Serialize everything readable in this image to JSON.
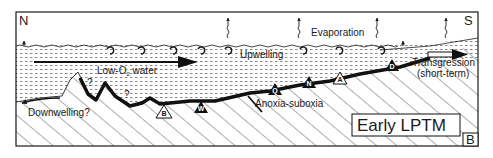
{
  "figure": {
    "panel_label": "B",
    "title": "Early LPTM",
    "colors": {
      "ink": "#1a1a1a",
      "background": "#ffffff"
    }
  },
  "compass": {
    "left": "N",
    "right": "S"
  },
  "labels": {
    "evaporation": "Evaporation",
    "upwelling": "Upwelling",
    "low_o2_water_prefix": "Low-O",
    "low_o2_water_sub": "2",
    "low_o2_water_suffix": " water",
    "downwelling": "Downwelling?",
    "anoxia": "Anoxia-suboxia",
    "transgression_line1": "Transgression",
    "transgression_line2": "(short-term)",
    "question_mark": "?"
  },
  "sites": [
    {
      "code": "B",
      "style": "open"
    },
    {
      "code": "W",
      "style": "filled"
    },
    {
      "code": "Q",
      "style": "filled"
    },
    {
      "code": "N",
      "style": "filled"
    },
    {
      "code": "A",
      "style": "open"
    },
    {
      "code": "D",
      "style": "filled"
    }
  ]
}
